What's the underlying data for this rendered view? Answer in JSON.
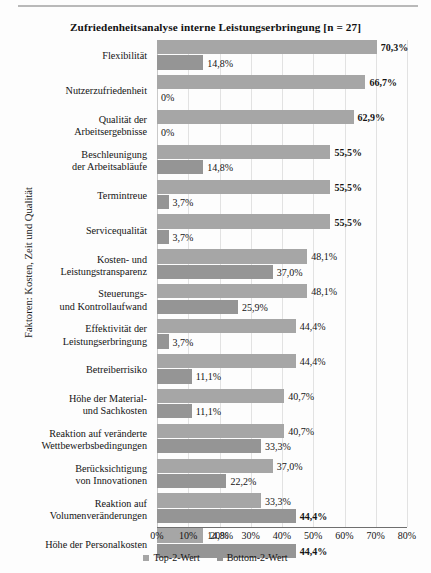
{
  "chart_data": {
    "type": "bar",
    "orientation": "horizontal",
    "title": "Zufriedenheitsanalyse interne Leistungserbringung [n = 27]",
    "xlabel": "",
    "ylabel": "Faktoren: Kosten, Zeit und Qualität",
    "xlim": [
      0,
      80
    ],
    "xtick_labels": [
      "0%",
      "10%",
      "20%",
      "30%",
      "40%",
      "50%",
      "60%",
      "70%",
      "80%"
    ],
    "xticks": [
      0,
      10,
      20,
      30,
      40,
      50,
      60,
      70,
      80
    ],
    "grid": true,
    "legend_position": "bottom",
    "categories": [
      "Flexibilität",
      "Nutzerzufriedenheit",
      "Qualität der\nArbeitsergebnisse",
      "Beschleunigung\nder Arbeitsabläufe",
      "Termintreue",
      "Servicequalität",
      "Kosten- und\nLeistungstransparenz",
      "Steuerungs-\nund Kontrollaufwand",
      "Effektivität der\nLeistungserbringung",
      "Betreiberrisiko",
      "Höhe der Material-\nund Sachkosten",
      "Reaktion auf veränderte\nWettbewerbsbedingungen",
      "Berücksichtigung\nvon Innovationen",
      "Reaktion auf\nVolumenveränderungen",
      "Höhe der Personalkosten"
    ],
    "series": [
      {
        "name": "Top-2-Wert",
        "color": "#a6a6a6",
        "values": [
          70.3,
          66.7,
          62.9,
          55.5,
          55.5,
          55.5,
          48.1,
          48.1,
          44.4,
          44.4,
          40.7,
          40.7,
          37.0,
          33.3,
          14.8
        ],
        "labels": [
          "70,3%",
          "66,7%",
          "62,9%",
          "55,5%",
          "55,5%",
          "55,5%",
          "48,1%",
          "48,1%",
          "44,4%",
          "44,4%",
          "40,7%",
          "40,7%",
          "37,0%",
          "33,3%",
          "14,8%"
        ],
        "label_bold": [
          true,
          true,
          true,
          true,
          true,
          true,
          false,
          false,
          false,
          false,
          false,
          false,
          false,
          false,
          false
        ]
      },
      {
        "name": "Bottom-2-Wert",
        "color": "#959595",
        "values": [
          14.8,
          0,
          0,
          14.8,
          3.7,
          3.7,
          37.0,
          25.9,
          3.7,
          11.1,
          11.1,
          33.3,
          22.2,
          44.4,
          44.4
        ],
        "labels": [
          "14,8%",
          "0%",
          "0%",
          "14,8%",
          "3,7%",
          "3,7%",
          "37,0%",
          "25,9%",
          "3,7%",
          "11,1%",
          "11,1%",
          "33,3%",
          "22,2%",
          "44,4%",
          "44,4%"
        ],
        "label_bold": [
          false,
          false,
          false,
          false,
          false,
          false,
          false,
          false,
          false,
          false,
          false,
          false,
          false,
          true,
          true
        ]
      }
    ]
  },
  "legend": {
    "items": [
      {
        "label": "Top-2-Wert",
        "color": "#a6a6a6"
      },
      {
        "label": "Bottom-2-Wert",
        "color": "#959595"
      }
    ]
  }
}
